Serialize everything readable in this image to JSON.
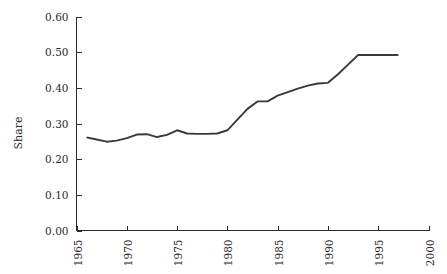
{
  "chart_data": {
    "type": "line",
    "title": "",
    "subtitle": "",
    "xlabel": "",
    "ylabel": "Share",
    "xlim": [
      1965,
      2000
    ],
    "ylim": [
      0.0,
      0.6
    ],
    "grid": false,
    "legend": null,
    "x_ticks": [
      "1965",
      "1970",
      "1975",
      "1980",
      "1985",
      "1990",
      "1995",
      "2000"
    ],
    "x_tick_values": [
      1965,
      1970,
      1975,
      1980,
      1985,
      1990,
      1995,
      2000
    ],
    "y_ticks": [
      "0.00",
      "0.10",
      "0.20",
      "0.30",
      "0.40",
      "0.50",
      "0.60"
    ],
    "y_tick_values": [
      0.0,
      0.1,
      0.2,
      0.3,
      0.4,
      0.5,
      0.6
    ],
    "series": [
      {
        "name": "Share",
        "color": "#3a3a3a",
        "x": [
          1966,
          1967,
          1968,
          1969,
          1970,
          1971,
          1972,
          1973,
          1974,
          1975,
          1976,
          1977,
          1978,
          1979,
          1980,
          1981,
          1982,
          1983,
          1984,
          1985,
          1986,
          1987,
          1988,
          1989,
          1990,
          1991,
          1992,
          1993,
          1994,
          1995,
          1996,
          1997
        ],
        "values": [
          0.261,
          0.255,
          0.249,
          0.252,
          0.259,
          0.269,
          0.27,
          0.262,
          0.268,
          0.281,
          0.272,
          0.271,
          0.271,
          0.272,
          0.281,
          0.311,
          0.341,
          0.362,
          0.362,
          0.378,
          0.388,
          0.398,
          0.406,
          0.412,
          0.414,
          0.438,
          0.465,
          0.492,
          0.492,
          0.492,
          0.492,
          0.492
        ]
      }
    ]
  },
  "axes": {
    "y_axis_title": "Share"
  }
}
